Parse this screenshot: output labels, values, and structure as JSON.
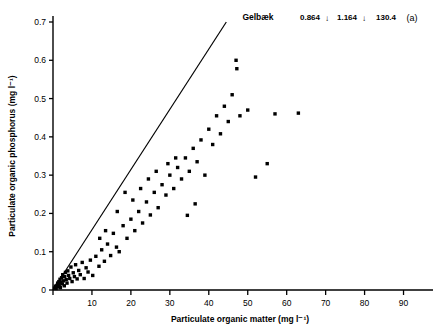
{
  "chart_data": {
    "type": "scatter",
    "title": "Gelbæk",
    "panel_label": "(a)",
    "xlabel": "Particulate organic matter (mg l⁻¹)",
    "ylabel": "Particulate organic phosphorus (mg l⁻¹)",
    "xlim": [
      0,
      95
    ],
    "ylim": [
      0,
      0.7
    ],
    "xticks": [
      0,
      10,
      20,
      30,
      40,
      50,
      60,
      70,
      80,
      90
    ],
    "xtick_labels": [
      "",
      "10",
      "20",
      "30",
      "40",
      "50",
      "60",
      "70",
      "80",
      "90"
    ],
    "yticks": [
      0,
      0.1,
      0.2,
      0.3,
      0.4,
      0.5,
      0.6,
      0.7
    ],
    "ytick_labels": [
      "0",
      "0.1",
      "0.2",
      "0.3",
      "0.4",
      "0.5",
      "0.6",
      "0.7"
    ],
    "grid": false,
    "legend": "none",
    "marker": "filled-square",
    "marker_color": "#000000",
    "annotations": [
      {
        "name": "stat-1",
        "text": "0.864"
      },
      {
        "name": "stat-arrow-1",
        "text": "↓"
      },
      {
        "name": "stat-2",
        "text": "1.164"
      },
      {
        "name": "stat-arrow-2",
        "text": "↓"
      },
      {
        "name": "stat-3",
        "text": "130.4"
      }
    ],
    "regression_line": {
      "name": "regression-line",
      "x_start": 0.0,
      "y_start": 0.0,
      "x_end": 44.5,
      "y_end": 0.7,
      "slope": 0.01573,
      "intercept": 0.0
    },
    "points": [
      [
        0.4,
        0.005
      ],
      [
        0.6,
        0.01
      ],
      [
        0.8,
        0.004
      ],
      [
        1.0,
        0.012
      ],
      [
        1.2,
        0.018
      ],
      [
        1.3,
        0.008
      ],
      [
        1.5,
        0.022
      ],
      [
        1.6,
        0.014
      ],
      [
        1.8,
        0.028
      ],
      [
        1.9,
        0.006
      ],
      [
        2.0,
        0.02
      ],
      [
        2.2,
        0.032
      ],
      [
        2.4,
        0.016
      ],
      [
        2.5,
        0.04
      ],
      [
        2.7,
        0.024
      ],
      [
        2.9,
        0.011
      ],
      [
        3.0,
        0.035
      ],
      [
        3.2,
        0.046
      ],
      [
        3.4,
        0.027
      ],
      [
        3.6,
        0.018
      ],
      [
        3.8,
        0.05
      ],
      [
        4.0,
        0.038
      ],
      [
        4.3,
        0.03
      ],
      [
        4.6,
        0.06
      ],
      [
        4.9,
        0.022
      ],
      [
        5.2,
        0.045
      ],
      [
        5.5,
        0.035
      ],
      [
        5.8,
        0.066
      ],
      [
        6.2,
        0.029
      ],
      [
        6.6,
        0.051
      ],
      [
        7.0,
        0.04
      ],
      [
        7.5,
        0.072
      ],
      [
        8.0,
        0.03
      ],
      [
        8.5,
        0.058
      ],
      [
        9.0,
        0.047
      ],
      [
        9.6,
        0.078
      ],
      [
        10.2,
        0.038
      ],
      [
        11.0,
        0.088
      ],
      [
        11.8,
        0.062
      ],
      [
        12.5,
        0.105
      ],
      [
        13.2,
        0.075
      ],
      [
        14.0,
        0.12
      ],
      [
        14.8,
        0.09
      ],
      [
        15.5,
        0.148
      ],
      [
        16.3,
        0.112
      ],
      [
        17.0,
        0.1
      ],
      [
        18.0,
        0.168
      ],
      [
        19.0,
        0.135
      ],
      [
        20.0,
        0.185
      ],
      [
        21.0,
        0.155
      ],
      [
        22.0,
        0.205
      ],
      [
        23.0,
        0.175
      ],
      [
        24.0,
        0.23
      ],
      [
        25.0,
        0.196
      ],
      [
        26.0,
        0.255
      ],
      [
        27.0,
        0.215
      ],
      [
        28.0,
        0.275
      ],
      [
        29.0,
        0.248
      ],
      [
        30.0,
        0.3
      ],
      [
        31.0,
        0.265
      ],
      [
        32.0,
        0.32
      ],
      [
        33.0,
        0.29
      ],
      [
        34.0,
        0.345
      ],
      [
        35.0,
        0.31
      ],
      [
        36.0,
        0.37
      ],
      [
        37.0,
        0.335
      ],
      [
        38.0,
        0.392
      ],
      [
        39.0,
        0.3
      ],
      [
        40.0,
        0.42
      ],
      [
        41.0,
        0.38
      ],
      [
        42.0,
        0.455
      ],
      [
        43.0,
        0.408
      ],
      [
        44.0,
        0.48
      ],
      [
        45.0,
        0.44
      ],
      [
        46.0,
        0.51
      ],
      [
        47.0,
        0.6
      ],
      [
        47.2,
        0.578
      ],
      [
        48.0,
        0.455
      ],
      [
        50.0,
        0.47
      ],
      [
        52.0,
        0.295
      ],
      [
        55.0,
        0.33
      ],
      [
        57.0,
        0.46
      ],
      [
        63.0,
        0.462
      ],
      [
        34.5,
        0.195
      ],
      [
        36.5,
        0.225
      ],
      [
        29.5,
        0.33
      ],
      [
        31.5,
        0.345
      ],
      [
        26.5,
        0.31
      ],
      [
        24.5,
        0.29
      ],
      [
        22.5,
        0.265
      ],
      [
        20.5,
        0.235
      ],
      [
        18.5,
        0.255
      ],
      [
        16.5,
        0.205
      ],
      [
        13.5,
        0.155
      ],
      [
        12.0,
        0.135
      ]
    ]
  }
}
